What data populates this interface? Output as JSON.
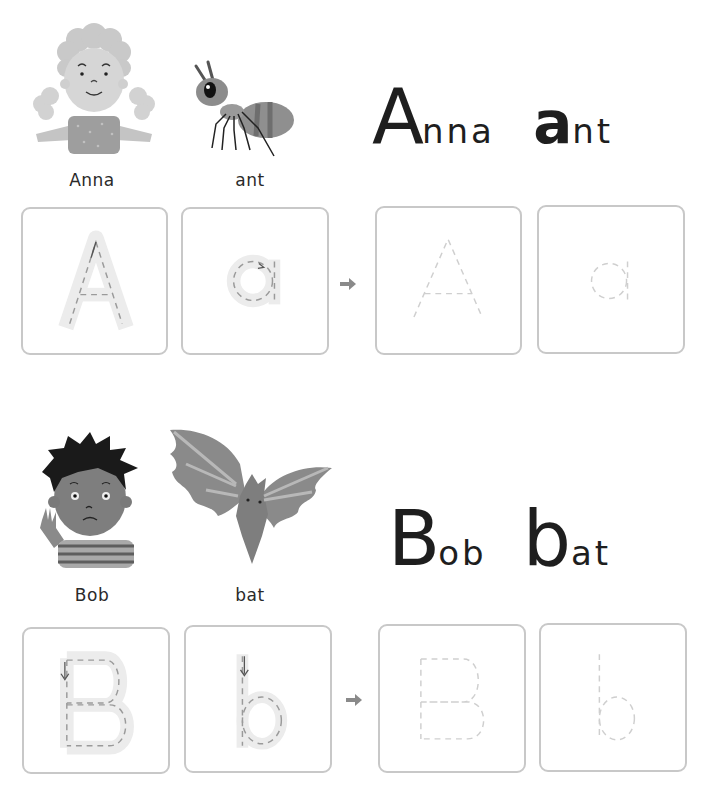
{
  "page": {
    "sections": [
      {
        "letter": "A",
        "illustrations": [
          {
            "name": "girl",
            "caption": "Anna"
          },
          {
            "name": "ant",
            "caption": "ant"
          }
        ],
        "heading": {
          "word1_initial": "A",
          "word1_rest": "nna",
          "word2_initial": "a",
          "word2_rest": "nt"
        },
        "tracing_boxes": [
          {
            "glyph": "A",
            "style": "guided",
            "label": "uppercase A with stroke guide"
          },
          {
            "glyph": "a",
            "style": "guided",
            "label": "lowercase a with stroke guide"
          },
          {
            "glyph": "A",
            "style": "dotted",
            "label": "uppercase A dotted practice"
          },
          {
            "glyph": "a",
            "style": "dotted",
            "label": "lowercase a dotted practice"
          }
        ],
        "arrow_icon": "right-arrow"
      },
      {
        "letter": "B",
        "illustrations": [
          {
            "name": "boy",
            "caption": "Bob"
          },
          {
            "name": "bat",
            "caption": "bat"
          }
        ],
        "heading": {
          "word1_initial": "B",
          "word1_rest": "ob",
          "word2_initial": "b",
          "word2_rest": "at"
        },
        "tracing_boxes": [
          {
            "glyph": "B",
            "style": "guided",
            "label": "uppercase B with stroke guide"
          },
          {
            "glyph": "b",
            "style": "guided",
            "label": "lowercase b with stroke guide"
          },
          {
            "glyph": "B",
            "style": "dotted",
            "label": "uppercase B dotted practice"
          },
          {
            "glyph": "b",
            "style": "dotted",
            "label": "lowercase b dotted practice"
          }
        ],
        "arrow_icon": "right-arrow"
      }
    ],
    "colors": {
      "box_border": "#c8c8c8",
      "guide_fill": "#ececec",
      "guide_dash": "#9a9a9a",
      "dotted_dash": "#cfcfcf",
      "arrow": "#8a8a8a",
      "text": "#1e1e1e"
    }
  }
}
